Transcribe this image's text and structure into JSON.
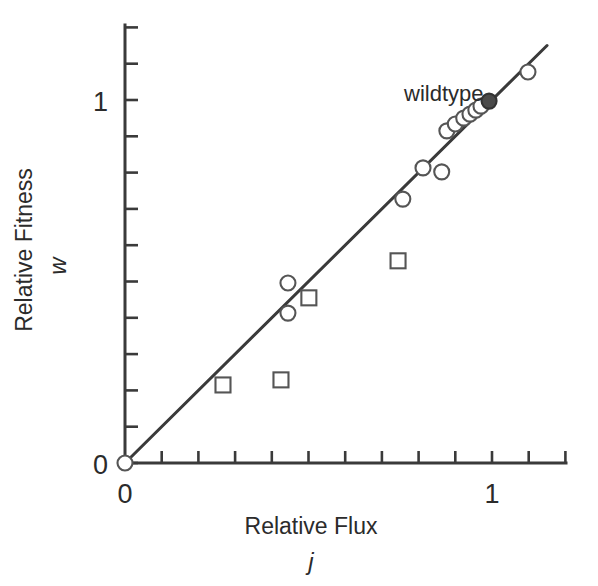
{
  "chart_data": {
    "type": "scatter",
    "title": "",
    "xlabel": "Relative Flux",
    "xlabel_variable": "j",
    "ylabel": "Relative Fitness",
    "ylabel_variable": "w",
    "xlim": [
      0,
      1.2
    ],
    "ylim": [
      0,
      1.22
    ],
    "xticks": [
      0,
      0.1,
      0.2,
      0.3,
      0.4,
      0.5,
      0.6,
      0.7,
      0.8,
      0.9,
      1.0,
      1.1,
      1.2
    ],
    "yticks": [
      0,
      0.1,
      0.2,
      0.3,
      0.4,
      0.5,
      0.6,
      0.7,
      0.8,
      0.9,
      1.0,
      1.1,
      1.2
    ],
    "xtick_labels_shown": {
      "0": "0",
      "1": "1"
    },
    "ytick_labels_shown": {
      "0": "0",
      "1": "1"
    },
    "grid": false,
    "legend": "none",
    "annotations": [
      {
        "text": "wildtype",
        "x": 0.88,
        "y": 1.02,
        "points_to": {
          "x": 1.0,
          "y": 1.0
        }
      }
    ],
    "reference_line": {
      "name": "identity-line",
      "from": {
        "x": 0.0,
        "y": 0.0
      },
      "to": {
        "x": 1.15,
        "y": 1.15
      },
      "color": "#3a3a3a"
    },
    "series": [
      {
        "name": "open-circles",
        "marker": "open-circle",
        "color": "#555555",
        "points": [
          {
            "x": 0.0,
            "y": 0.0
          },
          {
            "x": 0.444,
            "y": 0.496
          },
          {
            "x": 0.444,
            "y": 0.413
          },
          {
            "x": 0.757,
            "y": 0.727
          },
          {
            "x": 0.812,
            "y": 0.813
          },
          {
            "x": 0.863,
            "y": 0.802
          },
          {
            "x": 0.877,
            "y": 0.915
          },
          {
            "x": 0.9,
            "y": 0.934
          },
          {
            "x": 0.923,
            "y": 0.95
          },
          {
            "x": 0.94,
            "y": 0.961
          },
          {
            "x": 0.956,
            "y": 0.972
          },
          {
            "x": 0.97,
            "y": 0.983
          },
          {
            "x": 1.098,
            "y": 1.077
          }
        ]
      },
      {
        "name": "wildtype-filled-circle",
        "marker": "filled-circle",
        "color": "#4a4a4a",
        "points": [
          {
            "x": 0.992,
            "y": 0.997
          }
        ]
      },
      {
        "name": "open-squares",
        "marker": "open-square",
        "color": "#555555",
        "points": [
          {
            "x": 0.267,
            "y": 0.215
          },
          {
            "x": 0.425,
            "y": 0.229
          },
          {
            "x": 0.501,
            "y": 0.455
          },
          {
            "x": 0.744,
            "y": 0.557
          }
        ]
      }
    ]
  },
  "figure": {
    "axis_color": "#3a3a3a",
    "background": "#ffffff",
    "x_axis_label_shown_zero": "0",
    "x_axis_label_shown_one": "1",
    "y_axis_label_shown_zero": "0",
    "y_axis_label_shown_one": "1",
    "annotation_wildtype": "wildtype",
    "x_title": "Relative Flux",
    "x_title_var": "j",
    "y_title": "Relative Fitness",
    "y_title_var": "w"
  }
}
